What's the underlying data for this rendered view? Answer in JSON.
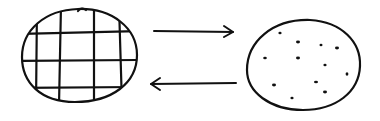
{
  "diagram": {
    "colors": {
      "stroke": "#111111",
      "background": "#ffffff"
    },
    "left_shape": {
      "type": "gridded-circle",
      "grid_vertical_lines": 4,
      "grid_horizontal_lines": 3
    },
    "right_shape": {
      "type": "dotted-circle",
      "dot_count": 13
    },
    "arrows": [
      {
        "direction": "right",
        "from": "left_shape",
        "to": "right_shape"
      },
      {
        "direction": "left",
        "from": "right_shape",
        "to": "left_shape"
      }
    ]
  }
}
